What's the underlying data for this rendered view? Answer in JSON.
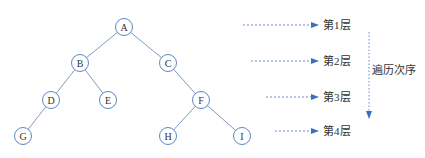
{
  "tree": {
    "edge_color": "#7f9cc4",
    "node_stroke": "#5f85c0",
    "text_color": "#333333",
    "nodes": [
      {
        "id": "A",
        "label": "A",
        "x": 124,
        "y": 27
      },
      {
        "id": "B",
        "label": "B",
        "x": 80,
        "y": 63
      },
      {
        "id": "C",
        "label": "C",
        "x": 168,
        "y": 63
      },
      {
        "id": "D",
        "label": "D",
        "x": 51,
        "y": 100
      },
      {
        "id": "E",
        "label": "E",
        "x": 108,
        "y": 100
      },
      {
        "id": "F",
        "label": "F",
        "x": 201,
        "y": 100
      },
      {
        "id": "G",
        "label": "G",
        "x": 23,
        "y": 136
      },
      {
        "id": "H",
        "label": "H",
        "x": 168,
        "y": 136
      },
      {
        "id": "I",
        "label": "I",
        "x": 242,
        "y": 136
      }
    ],
    "edges": [
      [
        "A",
        "B"
      ],
      [
        "A",
        "C"
      ],
      [
        "B",
        "D"
      ],
      [
        "B",
        "E"
      ],
      [
        "C",
        "F"
      ],
      [
        "D",
        "G"
      ],
      [
        "F",
        "H"
      ],
      [
        "F",
        "I"
      ]
    ]
  },
  "levels": {
    "arrow_color": "#3f6fb8",
    "items": [
      {
        "label": "第1层",
        "y": 25,
        "x_start": 243
      },
      {
        "label": "第2层",
        "y": 61,
        "x_start": 251
      },
      {
        "label": "第3层",
        "y": 97,
        "x_start": 266
      },
      {
        "label": "第4层",
        "y": 131,
        "x_start": 275
      }
    ]
  },
  "traversal": {
    "label": "遍历次序",
    "x": 369,
    "y_start": 32,
    "y_end": 118
  }
}
